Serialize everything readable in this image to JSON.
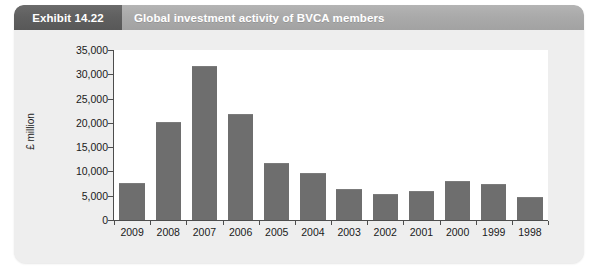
{
  "exhibit": {
    "number_label": "Exhibit 14.22",
    "title": "Global investment activity of BVCA members",
    "header_bg": "#aaaaaa",
    "number_bg": "#606060",
    "panel_bg": "#eeeeee"
  },
  "chart_data": {
    "type": "bar",
    "title": "Global investment activity of BVCA members",
    "subtitle": "",
    "xlabel": "",
    "ylabel": "£ million",
    "categories": [
      "2009",
      "2008",
      "2007",
      "2006",
      "2005",
      "2004",
      "2003",
      "2002",
      "2001",
      "2000",
      "1999",
      "1998"
    ],
    "values": [
      7400,
      19900,
      31500,
      21600,
      11500,
      9500,
      6100,
      5100,
      5700,
      7800,
      7300,
      4500
    ],
    "ylim": [
      0,
      35000
    ],
    "ytick_values": [
      0,
      5000,
      10000,
      15000,
      20000,
      25000,
      30000,
      35000
    ],
    "ytick_labels": [
      "0",
      "5,000",
      "10,000",
      "15,000",
      "20,000",
      "25,000",
      "30,000",
      "35,000"
    ],
    "grid": false,
    "legend": false,
    "bar_color": "#6e6e6e",
    "plot_bg": "#ffffff"
  }
}
